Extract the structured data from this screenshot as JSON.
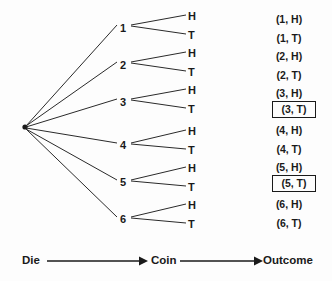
{
  "diagram": {
    "type": "probability-tree",
    "title": "",
    "root": {
      "x": 25,
      "y": 127,
      "label": ""
    },
    "stage_labels": [
      {
        "name": "die",
        "text": "Die",
        "x": 22,
        "y": 256
      },
      {
        "name": "coin",
        "text": "Coin",
        "x": 151,
        "y": 256
      },
      {
        "name": "outcome",
        "text": "Outcome",
        "x": 263,
        "y": 256
      }
    ],
    "die_branches": [
      {
        "label": "1",
        "x": 122,
        "y": 28
      },
      {
        "label": "2",
        "x": 122,
        "y": 65
      },
      {
        "label": "3",
        "x": 122,
        "y": 102
      },
      {
        "label": "4",
        "x": 122,
        "y": 145
      },
      {
        "label": "5",
        "x": 122,
        "y": 182
      },
      {
        "label": "6",
        "x": 122,
        "y": 219
      }
    ],
    "coin_branches": [
      {
        "label": "H",
        "x": 190,
        "y": 17
      },
      {
        "label": "T",
        "x": 190,
        "y": 36
      },
      {
        "label": "H",
        "x": 190,
        "y": 54
      },
      {
        "label": "T",
        "x": 190,
        "y": 73
      },
      {
        "label": "H",
        "x": 190,
        "y": 91
      },
      {
        "label": "T",
        "x": 190,
        "y": 110
      },
      {
        "label": "H",
        "x": 190,
        "y": 132
      },
      {
        "label": "T",
        "x": 190,
        "y": 151
      },
      {
        "label": "H",
        "x": 190,
        "y": 169
      },
      {
        "label": "T",
        "x": 190,
        "y": 188
      },
      {
        "label": "H",
        "x": 190,
        "y": 206
      },
      {
        "label": "T",
        "x": 190,
        "y": 225
      }
    ],
    "outcomes": [
      {
        "text": "(1, H)",
        "highlighted": false,
        "y": 16
      },
      {
        "text": "(1, T)",
        "highlighted": false,
        "y": 35
      },
      {
        "text": "(2, H)",
        "highlighted": false,
        "y": 53
      },
      {
        "text": "(2, T)",
        "highlighted": false,
        "y": 72
      },
      {
        "text": "(3, H)",
        "highlighted": false,
        "y": 90
      },
      {
        "text": "(3, T)",
        "highlighted": true,
        "y": 102
      },
      {
        "text": "(4, H)",
        "highlighted": false,
        "y": 127
      },
      {
        "text": "(4, T)",
        "highlighted": false,
        "y": 146
      },
      {
        "text": "(5, H)",
        "highlighted": false,
        "y": 164
      },
      {
        "text": "(5, T)",
        "highlighted": true,
        "y": 183
      },
      {
        "text": "(6, H)",
        "highlighted": false,
        "y": 205
      },
      {
        "text": "(6, T)",
        "highlighted": false,
        "y": 224
      }
    ],
    "colors": {
      "background": "#fdfdfd",
      "ink": "#1a1a1a",
      "line": "#2a2a2a"
    }
  }
}
